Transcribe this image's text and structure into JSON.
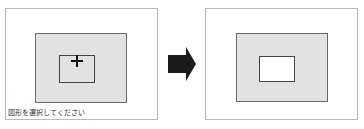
{
  "before_panel": {
    "caption": "図形を選択してください",
    "cursor_icon": "crosshair-icon",
    "canvas_color": "#e2e2e2",
    "shape_fill": "transparent"
  },
  "transition": {
    "icon": "arrow-right-icon",
    "color": "#1a1a1a"
  },
  "after_panel": {
    "canvas_color": "#e2e2e2",
    "shape_fill": "#ffffff"
  }
}
